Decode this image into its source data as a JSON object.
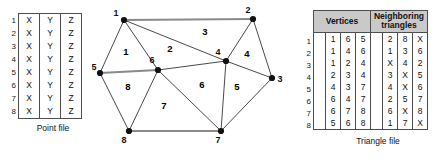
{
  "figure": {
    "point_file": {
      "caption": "Point file",
      "columns": [
        "X",
        "Y",
        "Z"
      ],
      "row_numbers": [
        "1",
        "2",
        "3",
        "4",
        "5",
        "6",
        "7",
        "8"
      ],
      "rows": [
        [
          "X",
          "Y",
          "Z"
        ],
        [
          "X",
          "Y",
          "Z"
        ],
        [
          "X",
          "Y",
          "Z"
        ],
        [
          "X",
          "Y",
          "Z"
        ],
        [
          "X",
          "Y",
          "Z"
        ],
        [
          "X",
          "Y",
          "Z"
        ],
        [
          "X",
          "Y",
          "Z"
        ],
        [
          "X",
          "Y",
          "Z"
        ]
      ]
    },
    "triangle_file": {
      "caption": "Triangle file",
      "header_vertices": "Vertices",
      "header_neighbors": "Neighboring triangles",
      "row_numbers": [
        "1",
        "2",
        "3",
        "4",
        "5",
        "6",
        "7",
        "8"
      ],
      "rows": [
        {
          "vertices": [
            "1",
            "6",
            "5"
          ],
          "neighbors": [
            "2",
            "8",
            "X"
          ]
        },
        {
          "vertices": [
            "1",
            "4",
            "6"
          ],
          "neighbors": [
            "1",
            "3",
            "6"
          ]
        },
        {
          "vertices": [
            "1",
            "2",
            "4"
          ],
          "neighbors": [
            "X",
            "4",
            "2"
          ]
        },
        {
          "vertices": [
            "2",
            "3",
            "4"
          ],
          "neighbors": [
            "3",
            "X",
            "5"
          ]
        },
        {
          "vertices": [
            "4",
            "3",
            "7"
          ],
          "neighbors": [
            "4",
            "X",
            "6"
          ]
        },
        {
          "vertices": [
            "6",
            "4",
            "7"
          ],
          "neighbors": [
            "2",
            "5",
            "7"
          ]
        },
        {
          "vertices": [
            "6",
            "7",
            "8"
          ],
          "neighbors": [
            "6",
            "X",
            "8"
          ]
        },
        {
          "vertices": [
            "5",
            "6",
            "8"
          ],
          "neighbors": [
            "1",
            "7",
            "X"
          ]
        }
      ]
    },
    "diagram": {
      "nodes": [
        {
          "id": "1",
          "x": 32,
          "y": 20,
          "lx": 24,
          "ly": 16
        },
        {
          "id": "2",
          "x": 161,
          "y": 19,
          "lx": 156,
          "ly": 13
        },
        {
          "id": "3",
          "x": 180,
          "y": 78,
          "lx": 188,
          "ly": 82
        },
        {
          "id": "4",
          "x": 134,
          "y": 61,
          "lx": 126,
          "ly": 55
        },
        {
          "id": "5",
          "x": 8,
          "y": 73,
          "lx": 2,
          "ly": 70
        },
        {
          "id": "6",
          "x": 66,
          "y": 70,
          "lx": 60,
          "ly": 63
        },
        {
          "id": "7",
          "x": 129,
          "y": 131,
          "lx": 126,
          "ly": 143
        },
        {
          "id": "8",
          "x": 37,
          "y": 131,
          "lx": 32,
          "ly": 143
        }
      ],
      "edges": [
        {
          "a": "1",
          "b": "2",
          "thick": true
        },
        {
          "a": "1",
          "b": "5",
          "thick": false
        },
        {
          "a": "1",
          "b": "6",
          "thick": false
        },
        {
          "a": "1",
          "b": "4",
          "thick": false
        },
        {
          "a": "2",
          "b": "4",
          "thick": false
        },
        {
          "a": "2",
          "b": "3",
          "thick": false
        },
        {
          "a": "3",
          "b": "4",
          "thick": false
        },
        {
          "a": "3",
          "b": "7",
          "thick": false
        },
        {
          "a": "4",
          "b": "6",
          "thick": false
        },
        {
          "a": "4",
          "b": "7",
          "thick": false
        },
        {
          "a": "5",
          "b": "6",
          "thick": true
        },
        {
          "a": "5",
          "b": "8",
          "thick": false
        },
        {
          "a": "6",
          "b": "7",
          "thick": false
        },
        {
          "a": "6",
          "b": "8",
          "thick": false
        },
        {
          "a": "7",
          "b": "8",
          "thick": true
        }
      ],
      "triangle_labels": [
        {
          "id": "1",
          "x": 34,
          "y": 55
        },
        {
          "id": "2",
          "x": 78,
          "y": 52
        },
        {
          "id": "3",
          "x": 113,
          "y": 35
        },
        {
          "id": "4",
          "x": 155,
          "y": 57
        },
        {
          "id": "5",
          "x": 145,
          "y": 90
        },
        {
          "id": "6",
          "x": 110,
          "y": 88
        },
        {
          "id": "7",
          "x": 72,
          "y": 109
        },
        {
          "id": "8",
          "x": 36,
          "y": 90
        }
      ]
    }
  }
}
